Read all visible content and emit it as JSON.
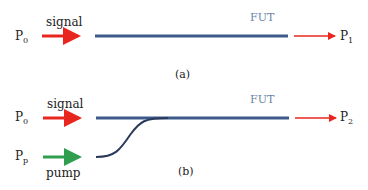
{
  "colors": {
    "signal": "#e8261e",
    "pump": "#2f9e4f",
    "fiber": "#3d5a8a",
    "fut_label": "#6b84a8",
    "output_arrow": "#e8261e"
  },
  "panel_a": {
    "input_label": "P",
    "input_sub": "0",
    "signal_label": "signal",
    "fut_label": "FUT",
    "output_label": "P",
    "output_sub": "1",
    "caption": "(a)"
  },
  "panel_b": {
    "input_label": "P",
    "input_sub": "0",
    "signal_label": "signal",
    "pump_input_label": "P",
    "pump_input_sub": "p",
    "pump_label": "pump",
    "fut_label": "FUT",
    "output_label": "P",
    "output_sub": "2",
    "caption": "(b)"
  }
}
